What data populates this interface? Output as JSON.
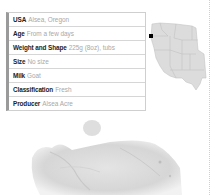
{
  "info_table": {
    "rows": [
      {
        "label": "USA",
        "value": "Alsea, Oregon"
      },
      {
        "label": "Age",
        "value": "From a few days"
      },
      {
        "label": "Weight and Shape",
        "value": "225g (8oz), tubs"
      },
      {
        "label": "Size",
        "value": "No size"
      },
      {
        "label": "Milk",
        "value": "Goat"
      },
      {
        "label": "Classification",
        "value": "Fresh"
      },
      {
        "label": "Producer",
        "value": "Alsea Acre"
      }
    ]
  },
  "map": {
    "region": "Western United States",
    "marker_location": "Oregon",
    "marker_color": "#000000",
    "fill_color": "#dcdcdc"
  },
  "photo": {
    "subject": "Fresh goat cheese crumbles"
  }
}
